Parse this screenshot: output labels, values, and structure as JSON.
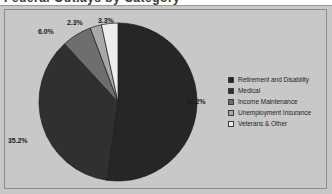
{
  "window": {
    "clipped_heading_fragment": "Federal Outlays by Category"
  },
  "chart_data": {
    "type": "pie",
    "title": "",
    "xlabel": "",
    "ylabel": "",
    "legend_position": "right",
    "grid": false,
    "start_angle_deg": 0,
    "direction": "clockwise",
    "categories": [
      "Retirement and Disability",
      "Medical",
      "Income Maintenance",
      "Unemployment Insurance",
      "Veterans & Other"
    ],
    "values": [
      51.2,
      35.2,
      6.0,
      2.3,
      3.3
    ],
    "value_labels": [
      "51.2%",
      "35.2%",
      "6.0%",
      "2.3%",
      "3.3%"
    ],
    "colors": [
      "#262626",
      "#303030",
      "#6e6e6e",
      "#a8a8a8",
      "#ededed"
    ],
    "slices": [
      {
        "label": "Retirement and Disability",
        "value": 51.2,
        "display": "51.2%",
        "color": "#262626"
      },
      {
        "label": "Medical",
        "value": 35.2,
        "display": "35.2%",
        "color": "#303030"
      },
      {
        "label": "Income Maintenance",
        "value": 6.0,
        "display": "6.0%",
        "color": "#6e6e6e"
      },
      {
        "label": "Unemployment Insurance",
        "value": 2.3,
        "display": "2.3%",
        "color": "#a8a8a8"
      },
      {
        "label": "Veterans & Other",
        "value": 3.3,
        "display": "3.3%",
        "color": "#ededed"
      }
    ]
  },
  "legend": {
    "items": [
      {
        "label": "Retirement and Disability",
        "color": "#262626"
      },
      {
        "label": "Medical",
        "color": "#303030"
      },
      {
        "label": "Income Maintenance",
        "color": "#6e6e6e"
      },
      {
        "label": "Unemployment Insurance",
        "color": "#a8a8a8"
      },
      {
        "label": "Veterans & Other",
        "color": "#ededed"
      }
    ]
  },
  "style": {
    "canvas_background": "#c8c8c8",
    "border_color": "#8d8d8d",
    "label_color": "#1c1c1c"
  }
}
